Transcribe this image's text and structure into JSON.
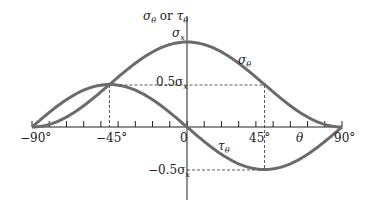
{
  "chart_data": {
    "type": "line",
    "title": "",
    "xlabel": "θ",
    "ylabel": "σθ or τθ",
    "xlim": [
      -90,
      90
    ],
    "ylim_in_sigma_x": [
      -1,
      1
    ],
    "x_tick_step_deg": 10,
    "x_tick_labels": [
      "-90°",
      "-45°",
      "0",
      "45°",
      "90°"
    ],
    "y_labels": [
      "σx",
      "0.5σx",
      "-0.5σx"
    ],
    "series": [
      {
        "name": "σθ",
        "formula": "σx·cos²θ",
        "x": [
          -90,
          -45,
          0,
          45,
          90
        ],
        "values": [
          0,
          0.5,
          1,
          0.5,
          0
        ]
      },
      {
        "name": "τθ",
        "formula": "-σx·sinθ·cosθ",
        "x": [
          -90,
          -45,
          0,
          45,
          90
        ],
        "values": [
          0,
          0.5,
          0,
          -0.5,
          0
        ]
      }
    ],
    "annotations": [
      "dashed guides at θ=±45° to 0.5σx and -0.5σx"
    ]
  },
  "labels": {
    "axis_title_sigma": "σ",
    "axis_title_sub1": "θ",
    "axis_title_or": " or ",
    "axis_title_tau": "τ",
    "axis_title_sub2": "θ",
    "sigma_x": "σ",
    "sigma_x_sub": "x",
    "half_sigma": "0.5σ",
    "half_sigma_sub": "x",
    "neg_half_sigma": "−0.5σ",
    "neg_half_sigma_sub": "x",
    "curve_sigma": "σ",
    "curve_sigma_sub": "θ",
    "curve_tau": "τ",
    "curve_tau_sub": "θ",
    "theta": "θ",
    "tick_m90": "−90°",
    "tick_m45": "−45°",
    "tick_0": "0",
    "tick_45": "45°",
    "tick_90": "90°"
  },
  "colors": {
    "curve": "#6b6b6b",
    "axis": "#222222"
  }
}
